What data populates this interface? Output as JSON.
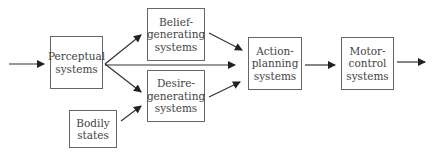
{
  "diagram": {
    "nodes": [
      {
        "id": "perceptual",
        "lines": [
          "Perceptual",
          "systems"
        ]
      },
      {
        "id": "belief",
        "lines": [
          "Belief-",
          "generating",
          "systems"
        ]
      },
      {
        "id": "desire",
        "lines": [
          "Desire-",
          "generating",
          "systems"
        ]
      },
      {
        "id": "bodily",
        "lines": [
          "Bodily",
          "states"
        ]
      },
      {
        "id": "action",
        "lines": [
          "Action-",
          "planning",
          "systems"
        ]
      },
      {
        "id": "motor",
        "lines": [
          "Motor-",
          "control",
          "systems"
        ]
      }
    ],
    "edges": [
      {
        "from": "input",
        "to": "perceptual"
      },
      {
        "from": "perceptual",
        "to": "belief"
      },
      {
        "from": "perceptual",
        "to": "desire"
      },
      {
        "from": "perceptual",
        "to": "action"
      },
      {
        "from": "bodily",
        "to": "desire"
      },
      {
        "from": "belief",
        "to": "action"
      },
      {
        "from": "desire",
        "to": "action"
      },
      {
        "from": "action",
        "to": "motor"
      },
      {
        "from": "motor",
        "to": "output"
      }
    ]
  }
}
